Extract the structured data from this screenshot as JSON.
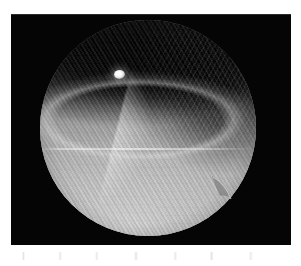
{
  "document": {
    "type": "scanned-figure",
    "background_color": "#ffffff",
    "page_width": 301,
    "page_height": 266
  },
  "figure": {
    "name": "fluoroscopic-radiograph",
    "modality": "fluoroscopy",
    "panel": {
      "background_color": "#050505",
      "left": 11,
      "top": 14,
      "width": 280,
      "height": 231
    },
    "field_of_view": {
      "shape": "circle",
      "name": "circular-image-intensifier-field",
      "center_x": 137,
      "center_y": 114,
      "diameter": 216,
      "rim_notch": {
        "name": "rim-notch",
        "position": "lower-right",
        "x": 211,
        "y": 175
      }
    },
    "regions": [
      {
        "name": "upper-dark-mass",
        "description": "dark soft-tissue band across the upper third of the field",
        "tone": "dark",
        "gray_hex": "#101010"
      },
      {
        "name": "right-dark-lobe",
        "description": "darker lobe with rib striations on the upper-right quadrant",
        "tone": "dark",
        "gray_hex": "#1d1d1d"
      },
      {
        "name": "bright-wedge",
        "description": "sharp bright wedge at the upper-left margin",
        "tone": "bright",
        "gray_hex": "#e8e8e8"
      },
      {
        "name": "lower-bright-field",
        "description": "broad bright lower hemisphere with diagonal grid moire",
        "tone": "bright",
        "gray_hex": "#bcbcbc"
      }
    ],
    "markers": [
      {
        "name": "bright-marker",
        "description": "small high-density metallic marker / surgical clip",
        "x": 108,
        "y": 61,
        "width": 11,
        "height": 9,
        "gray_hex": "#ffffff"
      }
    ],
    "artifacts": [
      {
        "name": "scanline",
        "description": "faint horizontal scan line across the mid-field",
        "y": 136
      },
      {
        "name": "grid-moire",
        "description": "diagonal anti-scatter grid moire pattern, lower-left to upper-right",
        "angle_deg": 58
      },
      {
        "name": "paper-speckle",
        "description": "faint scanning speckle on the white paper below the panel",
        "y": 256
      }
    ]
  }
}
